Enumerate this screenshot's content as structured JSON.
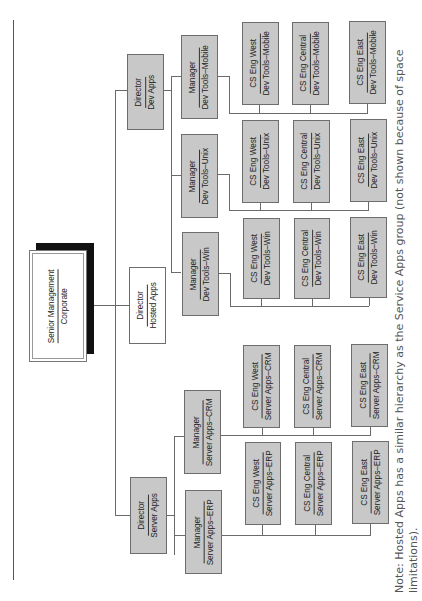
{
  "chart": {
    "orientation": "rotated-90-ccw",
    "root": {
      "title": "Senior Management",
      "subtitle": "Corporate"
    },
    "directors": [
      {
        "title": "Director",
        "subtitle": "Server Apps",
        "fill": "#c8c8c8"
      },
      {
        "title": "Director",
        "subtitle": "Hosted Apps",
        "fill": "#ffffff"
      },
      {
        "title": "Director",
        "subtitle": "Dev Apps",
        "fill": "#c8c8c8"
      }
    ],
    "managers": [
      {
        "title": "Manager",
        "subtitle": "Server Apps–ERP"
      },
      {
        "title": "Manager",
        "subtitle": "Server Apps–CRM"
      },
      {
        "title": "Manager",
        "subtitle": "Dev Tools–Win"
      },
      {
        "title": "Manager",
        "subtitle": "Dev Tools–Unix"
      },
      {
        "title": "Manager",
        "subtitle": "Dev Tools–Mobile"
      }
    ],
    "teams": {
      "erp": [
        {
          "title": "CS Eng West",
          "subtitle": "Server Apps–ERP"
        },
        {
          "title": "CS Eng Central",
          "subtitle": "Server Apps–ERP"
        },
        {
          "title": "CS Eng East",
          "subtitle": "Server Apps–ERP"
        }
      ],
      "crm": [
        {
          "title": "CS Eng West",
          "subtitle": "Server Apps–CRM"
        },
        {
          "title": "CS Eng Central",
          "subtitle": "Server Apps–CRM"
        },
        {
          "title": "CS Eng East",
          "subtitle": "Server Apps–CRM"
        }
      ],
      "win": [
        {
          "title": "CS Eng West",
          "subtitle": "Dev Tools–Win"
        },
        {
          "title": "CS Eng Central",
          "subtitle": "Dev Tools–Win"
        },
        {
          "title": "CS Eng East",
          "subtitle": "Dev Tools–Win"
        }
      ],
      "unix": [
        {
          "title": "CS Eng West",
          "subtitle": "Dev Tools–Unix"
        },
        {
          "title": "CS Eng Central",
          "subtitle": "Dev Tools–Unix"
        },
        {
          "title": "CS Eng East",
          "subtitle": "Dev Tools–Unix"
        }
      ],
      "mobile": [
        {
          "title": "CS Eng West",
          "subtitle": "Dev Tools–Mobile"
        },
        {
          "title": "CS Eng Central",
          "subtitle": "Dev Tools–Mobile"
        },
        {
          "title": "CS Eng East",
          "subtitle": "Dev Tools–Mobile"
        }
      ]
    },
    "colors": {
      "gray_fill": "#c8c8c8",
      "white_fill": "#ffffff",
      "shadow": "#111111",
      "line": "#6a6a6a"
    }
  },
  "note": "Note: Hosted Apps has a similar hierarchy as the Service Apps group (not shown because of space limitations)."
}
